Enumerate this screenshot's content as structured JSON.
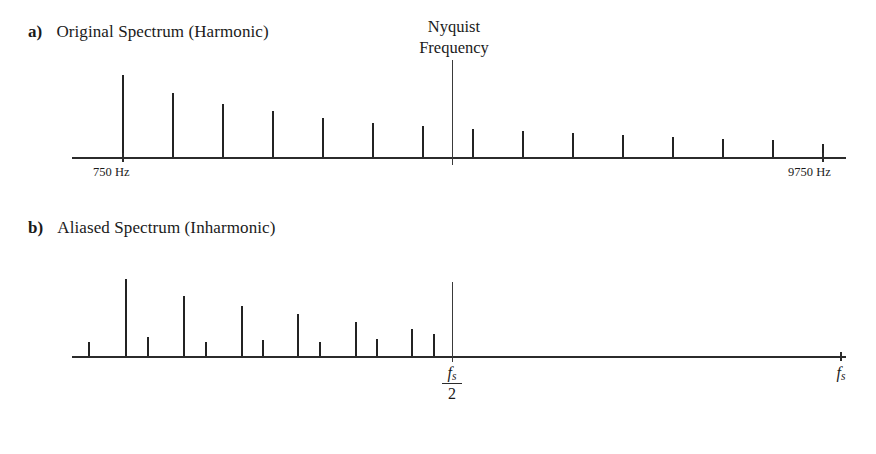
{
  "figure": {
    "width": 876,
    "height": 454,
    "background": "#ffffff",
    "ink_color": "#232323"
  },
  "panels": {
    "a": {
      "tag": "a)",
      "title": "Original Spectrum (Harmonic)",
      "left_label": "750 Hz",
      "right_label": "9750 Hz",
      "marker_label_line1": "Nyquist",
      "marker_label_line2": "Frequency"
    },
    "b": {
      "tag": "b)",
      "title": "Aliased Spectrum (Inharmonic)",
      "marker_numerator": "f",
      "marker_numerator_sub": "s",
      "marker_denominator": "2",
      "end_label": "f",
      "end_label_sub": "s"
    }
  },
  "chart_data": [
    {
      "id": "original-spectrum",
      "type": "bar",
      "title": "Original Spectrum (Harmonic)",
      "xlabel": "Frequency (Hz)",
      "ylabel": "Amplitude",
      "grid": false,
      "legend": null,
      "xlim": [
        0,
        10500
      ],
      "ylim": [
        0,
        1.0
      ],
      "axis_px": {
        "x0": 72,
        "x1": 846,
        "baseline_y": 157
      },
      "annotations": [
        {
          "text": "750 Hz",
          "x": 750,
          "position": "below-axis"
        },
        {
          "text": "9750 Hz",
          "x": 9750,
          "position": "below-axis"
        },
        {
          "text": "Nyquist Frequency",
          "x": 6000,
          "position": "above-axis",
          "marker": "vertical-line"
        }
      ],
      "categories": [
        750,
        1500,
        2250,
        3000,
        3750,
        4500,
        5250,
        6000,
        6750,
        7500,
        8250,
        9000,
        9750
      ],
      "values": [
        0.96,
        0.74,
        0.62,
        0.54,
        0.46,
        0.4,
        0.36,
        0.33,
        0.3,
        0.28,
        0.26,
        0.24,
        0.19
      ],
      "stem_px": [
        {
          "x": 122,
          "h": 82
        },
        {
          "x": 172,
          "h": 64
        },
        {
          "x": 222,
          "h": 53
        },
        {
          "x": 272,
          "h": 46
        },
        {
          "x": 322,
          "h": 39
        },
        {
          "x": 372,
          "h": 34
        },
        {
          "x": 422,
          "h": 31
        },
        {
          "x": 472,
          "h": 28
        },
        {
          "x": 522,
          "h": 26
        },
        {
          "x": 572,
          "h": 24
        },
        {
          "x": 622,
          "h": 22
        },
        {
          "x": 672,
          "h": 20
        },
        {
          "x": 722,
          "h": 18
        },
        {
          "x": 772,
          "h": 17
        },
        {
          "x": 822,
          "h": 13
        }
      ],
      "ticks_px": [
        122,
        822
      ]
    },
    {
      "id": "aliased-spectrum",
      "type": "bar",
      "title": "Aliased Spectrum (Inharmonic)",
      "xlabel": "Frequency",
      "ylabel": "Amplitude",
      "grid": false,
      "legend": null,
      "xlim": [
        0,
        1.0
      ],
      "ylim": [
        0,
        1.0
      ],
      "axis_px": {
        "x0": 72,
        "x1": 846,
        "baseline_y": 356
      },
      "annotations": [
        {
          "text": "fs/2",
          "x": 0.5,
          "position": "below-axis",
          "marker": "vertical-line"
        },
        {
          "text": "fs",
          "x": 1.0,
          "position": "below-axis",
          "marker": "tick"
        }
      ],
      "values": [
        0.2,
        0.95,
        0.22,
        0.74,
        0.18,
        0.62,
        0.2,
        0.52,
        0.18,
        0.42,
        0.2,
        0.34,
        0.22,
        0.3,
        0.26
      ],
      "stem_px": [
        {
          "x": 88,
          "h": 14
        },
        {
          "x": 125,
          "h": 77
        },
        {
          "x": 147,
          "h": 19
        },
        {
          "x": 183,
          "h": 60
        },
        {
          "x": 205,
          "h": 14
        },
        {
          "x": 241,
          "h": 50
        },
        {
          "x": 262,
          "h": 16
        },
        {
          "x": 297,
          "h": 42
        },
        {
          "x": 319,
          "h": 14
        },
        {
          "x": 355,
          "h": 34
        },
        {
          "x": 376,
          "h": 17
        },
        {
          "x": 411,
          "h": 27
        },
        {
          "x": 433,
          "h": 22
        }
      ],
      "ticks_px": [
        840
      ]
    }
  ]
}
